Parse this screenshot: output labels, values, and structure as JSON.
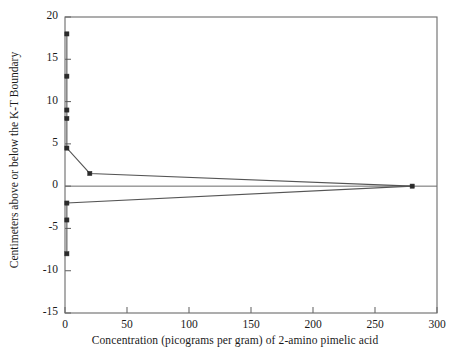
{
  "chart_data": {
    "type": "line",
    "title": "",
    "xlabel": "Concentration (picograms per gram) of 2-amino pimelic acid",
    "ylabel": "Centimeters above or below the K-T Boundary",
    "xlim": [
      0,
      300
    ],
    "ylim": [
      -15,
      20
    ],
    "xticks": [
      0,
      50,
      100,
      150,
      200,
      250,
      300
    ],
    "yticks": [
      20,
      15,
      10,
      5,
      0,
      -5,
      -10,
      -15
    ],
    "xtick_labels": [
      "0",
      "50",
      "100",
      "150",
      "200",
      "250",
      "300"
    ],
    "ytick_labels": [
      "20",
      "15",
      "10",
      "5",
      "0",
      "-5",
      "-10",
      "-15"
    ],
    "grid": false,
    "legend": "none",
    "marker": "square",
    "marker_color": "#2b2b2b",
    "line_color": "#555555",
    "axis_color": "#6b6b6b",
    "series": [
      {
        "name": "profile",
        "points": [
          {
            "x": 1.5,
            "y": 18.0
          },
          {
            "x": 1.5,
            "y": 13.0
          },
          {
            "x": 1.5,
            "y": 9.0
          },
          {
            "x": 1.5,
            "y": 8.0
          },
          {
            "x": 1.5,
            "y": 4.5
          },
          {
            "x": 20.0,
            "y": 1.5
          },
          {
            "x": 280.0,
            "y": 0.0
          },
          {
            "x": 1.5,
            "y": -2.0
          },
          {
            "x": 1.5,
            "y": -4.0
          },
          {
            "x": 1.5,
            "y": -8.0
          }
        ]
      }
    ],
    "paths": [
      {
        "name": "upper-branch",
        "vertices": [
          {
            "x": 1.5,
            "y": 18.0
          },
          {
            "x": 1.5,
            "y": 13.0
          },
          {
            "x": 1.5,
            "y": 9.0
          },
          {
            "x": 1.5,
            "y": 8.0
          },
          {
            "x": 1.5,
            "y": 4.5
          },
          {
            "x": 20.0,
            "y": 1.5
          },
          {
            "x": 280.0,
            "y": 0.0
          }
        ]
      },
      {
        "name": "lower-branch",
        "vertices": [
          {
            "x": 280.0,
            "y": 0.0
          },
          {
            "x": 1.5,
            "y": -2.0
          },
          {
            "x": 1.5,
            "y": -4.0
          },
          {
            "x": 1.5,
            "y": -8.0
          }
        ]
      }
    ]
  }
}
